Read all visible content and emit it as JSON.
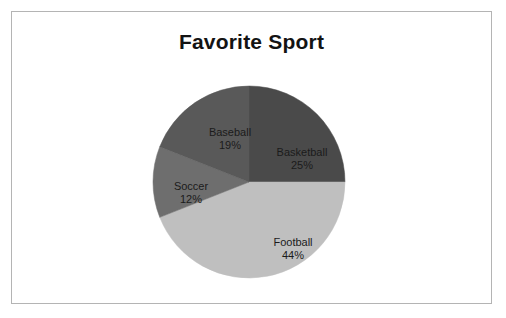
{
  "chart_data": {
    "type": "pie",
    "title": "Favorite Sport",
    "categories": [
      "Basketball",
      "Football",
      "Soccer",
      "Baseball"
    ],
    "values": [
      25,
      44,
      12,
      19
    ],
    "unit": "%",
    "total": 100,
    "legend": "none",
    "labels_inside_slices": true,
    "start_angle_deg": 0,
    "direction": "clockwise",
    "slices": [
      {
        "name": "Basketball",
        "value": 25,
        "value_label": "25%",
        "color": "#4a4a4a",
        "start_angle_deg": 0,
        "end_angle_deg": 90
      },
      {
        "name": "Football",
        "value": 44,
        "value_label": "44%",
        "color": "#bfbfbf",
        "start_angle_deg": 90,
        "end_angle_deg": 248.4
      },
      {
        "name": "Soccer",
        "value": 12,
        "value_label": "12%",
        "color": "#6e6e6e",
        "start_angle_deg": 248.4,
        "end_angle_deg": 291.6
      },
      {
        "name": "Baseball",
        "value": 19,
        "value_label": "19%",
        "color": "#595959",
        "start_angle_deg": 291.6,
        "end_angle_deg": 360
      }
    ]
  },
  "frame": {
    "border_color": "#b4b4b4",
    "background": "#ffffff"
  },
  "geometry": {
    "center_x": 237,
    "center_y": 170,
    "radius": 96
  }
}
